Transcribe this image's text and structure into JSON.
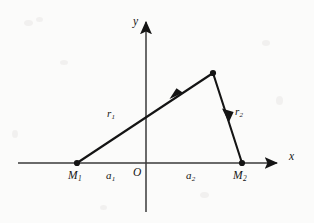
{
  "figure": {
    "type": "geometry-diagram",
    "background_color": "#fbfbfa",
    "ink_color": "#141414"
  },
  "axes": {
    "x": {
      "label": "x",
      "arrow": "right",
      "start_px": 18,
      "end_px": 282,
      "y_px": 163
    },
    "y": {
      "label": "y",
      "arrow": "up",
      "top_px": 18,
      "bottom_px": 212,
      "x_px": 146
    },
    "origin_label": "O"
  },
  "points": [
    {
      "name": "M1",
      "label": "M",
      "subscript": "1",
      "x_px": 77,
      "y_px": 163,
      "marker": "filled-dot"
    },
    {
      "name": "M2",
      "label": "M",
      "subscript": "2",
      "x_px": 242,
      "y_px": 163,
      "marker": "filled-dot"
    },
    {
      "name": "apex",
      "label": "",
      "subscript": "",
      "x_px": 213,
      "y_px": 73,
      "marker": "filled-dot"
    }
  ],
  "vectors": [
    {
      "name": "r1",
      "label": "r",
      "subscript": "1",
      "from": "M1",
      "to": "apex",
      "arrow_position": "midpoint",
      "arrow_direction": "toward-apex",
      "label_x_px": 110,
      "label_y_px": 114
    },
    {
      "name": "r2",
      "label": "r",
      "subscript": "2",
      "from": "apex",
      "to": "M2",
      "arrow_position": "midpoint",
      "arrow_direction": "toward-M2",
      "label_x_px": 234,
      "label_y_px": 111
    }
  ],
  "distances": [
    {
      "name": "a1",
      "label": "a",
      "subscript": "1",
      "from": "M1",
      "to": "O",
      "label_x_px": 110,
      "label_y_px": 175
    },
    {
      "name": "a2",
      "label": "a",
      "subscript": "2",
      "from": "O",
      "to": "M2",
      "label_x_px": 190,
      "label_y_px": 175
    }
  ]
}
